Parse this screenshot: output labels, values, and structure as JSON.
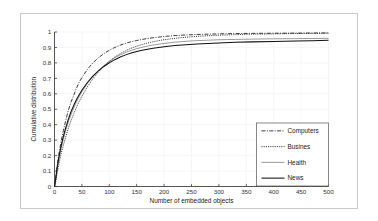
{
  "chart_data": {
    "type": "line",
    "title": "",
    "xlabel": "Number of embedded objects",
    "ylabel": "Cumulative distribution",
    "xlim": [
      0,
      500
    ],
    "ylim": [
      0,
      1
    ],
    "xticks": [
      "0",
      "50",
      "100",
      "150",
      "200",
      "250",
      "300",
      "350",
      "400",
      "450",
      "500"
    ],
    "yticks": [
      "0",
      "0.1",
      "0.2",
      "0.3",
      "0.4",
      "0.5",
      "0.6",
      "0.7",
      "0.8",
      "0.9",
      "1"
    ],
    "grid": true,
    "legend_position": "lower-right",
    "x": [
      0,
      2,
      5,
      8,
      12,
      16,
      20,
      25,
      30,
      35,
      40,
      45,
      50,
      60,
      70,
      80,
      90,
      100,
      110,
      120,
      130,
      140,
      150,
      160,
      170,
      180,
      190,
      200,
      220,
      240,
      260,
      280,
      300,
      330,
      360,
      400,
      440,
      470,
      500
    ],
    "series": [
      {
        "name": "Computers",
        "style": "dash-dot",
        "values": [
          0.0,
          0.05,
          0.14,
          0.21,
          0.29,
          0.36,
          0.42,
          0.49,
          0.545,
          0.59,
          0.635,
          0.675,
          0.705,
          0.758,
          0.8,
          0.833,
          0.86,
          0.882,
          0.9,
          0.915,
          0.927,
          0.937,
          0.945,
          0.952,
          0.958,
          0.963,
          0.967,
          0.971,
          0.977,
          0.981,
          0.984,
          0.986,
          0.988,
          0.99,
          0.991,
          0.992,
          0.993,
          0.9935,
          0.994
        ]
      },
      {
        "name": "Busines",
        "style": "dotted",
        "values": [
          0.0,
          0.03,
          0.09,
          0.145,
          0.21,
          0.265,
          0.315,
          0.375,
          0.425,
          0.47,
          0.512,
          0.55,
          0.584,
          0.645,
          0.697,
          0.74,
          0.778,
          0.81,
          0.838,
          0.86,
          0.879,
          0.895,
          0.908,
          0.919,
          0.929,
          0.937,
          0.944,
          0.95,
          0.959,
          0.966,
          0.972,
          0.976,
          0.979,
          0.983,
          0.986,
          0.988,
          0.99,
          0.991,
          0.992
        ]
      },
      {
        "name": "Health",
        "style": "solid-thin",
        "values": [
          0.0,
          0.04,
          0.115,
          0.175,
          0.245,
          0.305,
          0.357,
          0.415,
          0.465,
          0.508,
          0.547,
          0.582,
          0.613,
          0.667,
          0.712,
          0.75,
          0.782,
          0.81,
          0.833,
          0.852,
          0.868,
          0.881,
          0.892,
          0.901,
          0.909,
          0.916,
          0.921,
          0.926,
          0.934,
          0.94,
          0.944,
          0.947,
          0.95,
          0.952,
          0.954,
          0.956,
          0.957,
          0.958,
          0.959
        ]
      },
      {
        "name": "News",
        "style": "solid-thick",
        "values": [
          0.0,
          0.045,
          0.125,
          0.19,
          0.262,
          0.322,
          0.375,
          0.433,
          0.482,
          0.524,
          0.561,
          0.594,
          0.623,
          0.673,
          0.714,
          0.748,
          0.777,
          0.801,
          0.821,
          0.838,
          0.852,
          0.864,
          0.874,
          0.882,
          0.889,
          0.895,
          0.9,
          0.905,
          0.912,
          0.918,
          0.922,
          0.926,
          0.929,
          0.933,
          0.936,
          0.939,
          0.942,
          0.944,
          0.946
        ]
      }
    ]
  },
  "legend": {
    "entries": [
      {
        "label": "Computers"
      },
      {
        "label": "Busines"
      },
      {
        "label": "Health"
      },
      {
        "label": "News"
      }
    ]
  }
}
